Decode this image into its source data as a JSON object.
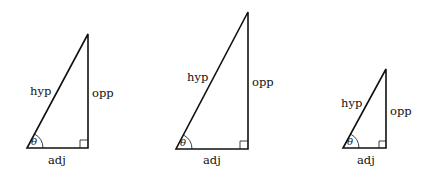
{
  "triangles": [
    {
      "id": "triangle-1",
      "labels": {
        "hyp": "hyp",
        "opp": "opp",
        "adj": "adj",
        "angle": "θ"
      },
      "vertices": {
        "angle": [
          27,
          148
        ],
        "right": [
          88,
          148
        ],
        "top": [
          88,
          34
        ]
      }
    },
    {
      "id": "triangle-2",
      "labels": {
        "hyp": "hyp",
        "opp": "opp",
        "adj": "adj",
        "angle": "θ"
      },
      "vertices": {
        "angle": [
          176,
          149
        ],
        "right": [
          248,
          149
        ],
        "top": [
          248,
          12
        ]
      }
    },
    {
      "id": "triangle-3",
      "labels": {
        "hyp": "hyp",
        "opp": "opp",
        "adj": "adj",
        "angle": "θ"
      },
      "vertices": {
        "angle": [
          343,
          148
        ],
        "right": [
          386,
          148
        ],
        "top": [
          386,
          69
        ]
      }
    }
  ]
}
